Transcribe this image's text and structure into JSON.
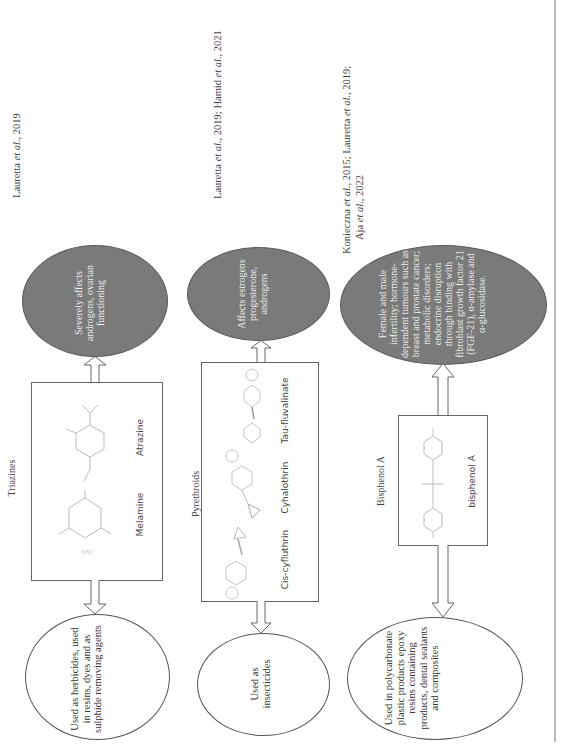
{
  "orientation": "rotated -90deg (text reads bottom-to-top)",
  "references": [
    {
      "text_parts": [
        {
          "t": "Lauretta "
        },
        {
          "t": "et al.",
          "i": true
        },
        {
          "t": ", 2019"
        }
      ]
    },
    {
      "text_parts": [
        {
          "t": "Lauretta "
        },
        {
          "t": "et al.",
          "i": true
        },
        {
          "t": ", 2019; Hamid "
        },
        {
          "t": "et al.",
          "i": true
        },
        {
          "t": ", 2021"
        }
      ]
    },
    {
      "line1_parts": [
        {
          "t": "Konieczna "
        },
        {
          "t": "et al.",
          "i": true
        },
        {
          "t": ", 2015; Lauretta "
        },
        {
          "t": "et al.",
          "i": true
        },
        {
          "t": ", 2019;"
        }
      ],
      "line2_parts": [
        {
          "t": "Aja "
        },
        {
          "t": "et al.",
          "i": true
        },
        {
          "t": ", 2022"
        }
      ]
    }
  ],
  "rows": [
    {
      "class_name": "Triazines",
      "effect": "Severely affects androgens, ovarian functioning",
      "use": "Used as herbicides, used in resins, dyes and as sulphide removing agents",
      "compounds": [
        "Melamine",
        "Atrazine"
      ]
    },
    {
      "class_name": "Pyrethroids",
      "effect": "Affects estrogens progesterone, androgens",
      "use": "Used as insecticides",
      "compounds": [
        "Cis-cyfluthrin",
        "Cyhalothrin",
        "Tau-fluvalinate"
      ]
    },
    {
      "class_name": "Bisphenol A",
      "effect": "Female and male infertility; hormone-dependent tumours such as breast and prostate cancer; metabolic disorders; endocrine disruption through binding with fibroblast growth factor 21 (FGF-21), α-amylase and α-glucosidase.",
      "use": "Used in polycarbonate plastic products epoxy resins containing products, dental sealants and composites",
      "compounds": [
        "bisphenol A"
      ]
    }
  ],
  "colors": {
    "effect_ellipse_fill": "#7a7a7a",
    "effect_text": "#ececec",
    "use_ellipse_fill": "#ffffff",
    "lines": "#666666"
  }
}
